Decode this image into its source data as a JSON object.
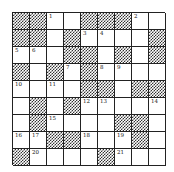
{
  "puzzle": {
    "type": "crossword",
    "rows": 9,
    "cols": 9,
    "layout": [
      "BB.#BBB.#",
      "BB#B..##B",
      "..#BB#B#B",
      "B#B.B..##",
      ".#.#BB#BB",
      "#B#B....",
      "#B.###BB#",
      "..BB.#.B#",
      "B.###B.##"
    ],
    "cells": [
      [
        {
          "b": 1
        },
        {
          "b": 1
        },
        {
          "n": "1"
        },
        {},
        {
          "b": 1
        },
        {
          "b": 1
        },
        {
          "b": 1
        },
        {
          "n": "2"
        },
        {}
      ],
      [
        {
          "b": 1
        },
        {
          "b": 1
        },
        {},
        {
          "b": 1
        },
        {
          "n": "3"
        },
        {
          "n": "4"
        },
        {},
        {},
        {
          "b": 1
        }
      ],
      [
        {
          "n": "5"
        },
        {
          "n": "6"
        },
        {},
        {
          "b": 1
        },
        {
          "b": 1
        },
        {},
        {
          "b": 1
        },
        {},
        {
          "b": 1
        }
      ],
      [
        {
          "b": 1
        },
        {},
        {
          "b": 1
        },
        {
          "n": "7"
        },
        {
          "b": 1
        },
        {
          "n": "8"
        },
        {
          "n": "9"
        },
        {},
        {}
      ],
      [
        {
          "n": "10"
        },
        {},
        {
          "n": "11"
        },
        {},
        {
          "b": 1
        },
        {
          "b": 1
        },
        {},
        {
          "b": 1
        },
        {
          "b": 1
        }
      ],
      [
        {},
        {
          "b": 1
        },
        {},
        {
          "b": 1
        },
        {
          "n": "12"
        },
        {
          "n": "13"
        },
        {},
        {},
        {
          "n": "14"
        }
      ],
      [
        {},
        {
          "b": 1
        },
        {
          "n": "15"
        },
        {},
        {},
        {},
        {
          "b": 1
        },
        {
          "b": 1
        },
        {}
      ],
      [
        {
          "n": "16"
        },
        {
          "n": "17"
        },
        {
          "b": 1
        },
        {
          "b": 1
        },
        {
          "n": "18"
        },
        {},
        {
          "n": "19"
        },
        {
          "b": 1
        },
        {}
      ],
      [
        {
          "b": 1
        },
        {
          "n": "20"
        },
        {},
        {},
        {},
        {
          "b": 1
        },
        {
          "n": "21"
        },
        {},
        {}
      ]
    ],
    "clue_numbers": [
      "1",
      "2",
      "3",
      "4",
      "5",
      "6",
      "7",
      "8",
      "9",
      "10",
      "11",
      "12",
      "13",
      "14",
      "15",
      "16",
      "17",
      "18",
      "19",
      "20",
      "21"
    ],
    "colors": {
      "block": "#333333",
      "grid_line": "#222222",
      "cell_bg": "#ffffff"
    }
  }
}
